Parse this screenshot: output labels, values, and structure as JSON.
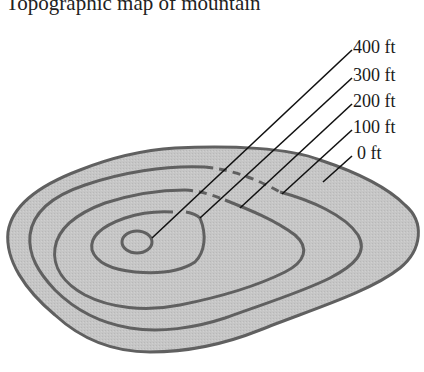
{
  "title": "Topographic map of mountain",
  "colors": {
    "land_fill": "#c4c4c4",
    "contour_stroke": "#606060",
    "leader_line": "#111111",
    "text": "#1a1a1a"
  },
  "contour_labels": [
    {
      "label": "400 ft",
      "elevation_ft": 400
    },
    {
      "label": "300 ft",
      "elevation_ft": 300
    },
    {
      "label": "200 ft",
      "elevation_ft": 200
    },
    {
      "label": "100 ft",
      "elevation_ft": 100
    },
    {
      "label": "0 ft",
      "elevation_ft": 0
    }
  ]
}
